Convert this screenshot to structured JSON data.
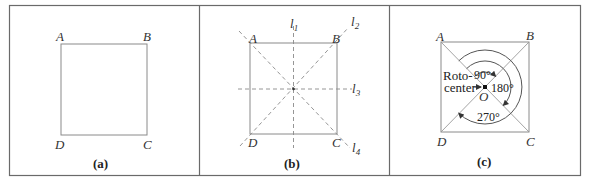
{
  "panels": [
    {
      "id": "a",
      "caption": "(a)",
      "vertices": {
        "A": "A",
        "B": "B",
        "C": "C",
        "D": "D"
      }
    },
    {
      "id": "b",
      "caption": "(b)",
      "vertices": {
        "A": "A",
        "B": "B",
        "C": "C",
        "D": "D"
      },
      "axes": [
        {
          "name": "l",
          "sub": "1"
        },
        {
          "name": "l",
          "sub": "2"
        },
        {
          "name": "l",
          "sub": "3"
        },
        {
          "name": "l",
          "sub": "4"
        }
      ]
    },
    {
      "id": "c",
      "caption": "(c)",
      "vertices": {
        "A": "A",
        "B": "B",
        "C": "C",
        "D": "D"
      },
      "center_label": "O",
      "roto_label_line1": "Roto-",
      "roto_label_line2": "center",
      "angles": [
        "90°",
        "180°",
        "270°"
      ]
    }
  ]
}
